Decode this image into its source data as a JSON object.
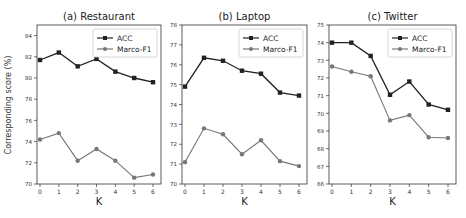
{
  "figure": {
    "shared_ylabel": "Corresponding score (%)",
    "xlabel": "K"
  },
  "colors": {
    "acc": "#222222",
    "f1": "#777777",
    "axis": "#333333",
    "legend_border": "#cccccc"
  },
  "chart_data": [
    {
      "type": "line",
      "title": "(a) Restaurant",
      "xlabel": "K",
      "ylabel": "Corresponding score (%)",
      "x": [
        0,
        1,
        2,
        3,
        4,
        5,
        6
      ],
      "xticks": [
        "0",
        "1",
        "2",
        "3",
        "4",
        "5",
        "6"
      ],
      "ylim": [
        70,
        85
      ],
      "yticks": [
        70,
        72,
        74,
        76,
        78,
        80,
        82,
        84
      ],
      "grid": false,
      "legend_position": "upper right",
      "series": [
        {
          "name": "ACC",
          "marker": "square",
          "values": [
            81.7,
            82.4,
            81.1,
            81.8,
            80.6,
            80.0,
            79.6
          ]
        },
        {
          "name": "Marco-F1",
          "marker": "circle",
          "values": [
            74.2,
            74.8,
            72.2,
            73.3,
            72.2,
            70.6,
            70.9
          ]
        }
      ]
    },
    {
      "type": "line",
      "title": "(b) Laptop",
      "xlabel": "K",
      "ylabel": "",
      "x": [
        0,
        1,
        2,
        3,
        4,
        5,
        6
      ],
      "xticks": [
        "0",
        "1",
        "2",
        "3",
        "4",
        "5",
        "6"
      ],
      "ylim": [
        70,
        78
      ],
      "yticks": [
        70,
        71,
        72,
        73,
        74,
        75,
        76,
        77,
        78
      ],
      "grid": false,
      "legend_position": "upper right",
      "series": [
        {
          "name": "ACC",
          "marker": "square",
          "values": [
            74.9,
            76.35,
            76.2,
            75.7,
            75.55,
            74.6,
            74.45
          ]
        },
        {
          "name": "Marco-F1",
          "marker": "circle",
          "values": [
            71.1,
            72.8,
            72.5,
            71.5,
            72.2,
            71.15,
            70.9
          ]
        }
      ]
    },
    {
      "type": "line",
      "title": "(c) Twitter",
      "xlabel": "K",
      "ylabel": "",
      "x": [
        0,
        1,
        2,
        3,
        4,
        5,
        6
      ],
      "xticks": [
        "0",
        "1",
        "2",
        "3",
        "4",
        "5",
        "6"
      ],
      "ylim": [
        66,
        75
      ],
      "yticks": [
        66,
        67,
        68,
        69,
        70,
        71,
        72,
        73,
        74,
        75
      ],
      "grid": false,
      "legend_position": "upper right",
      "series": [
        {
          "name": "ACC",
          "marker": "square",
          "values": [
            74.0,
            74.0,
            73.25,
            71.05,
            71.8,
            70.5,
            70.2
          ]
        },
        {
          "name": "Marco-F1",
          "marker": "circle",
          "values": [
            72.65,
            72.35,
            72.1,
            69.6,
            69.9,
            68.65,
            68.6
          ]
        }
      ]
    }
  ]
}
